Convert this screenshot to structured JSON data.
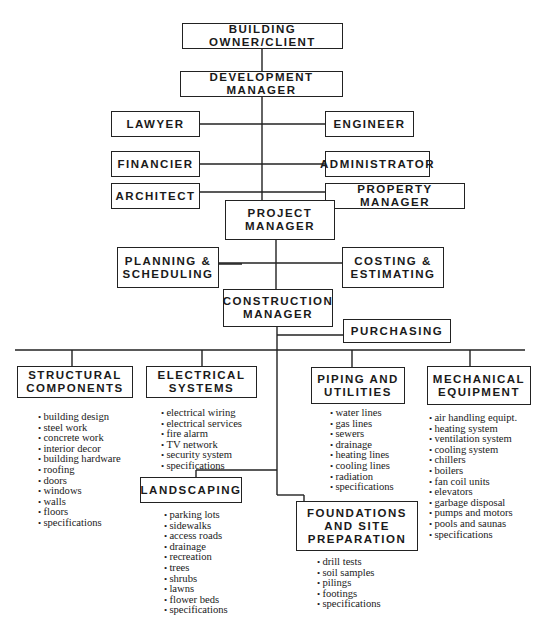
{
  "diagram": {
    "type": "organization-chart",
    "nodes": {
      "owner": "BUILDING OWNER/CLIENT",
      "dev_manager": "DEVELOPMENT MANAGER",
      "lawyer": "LAWYER",
      "engineer": "ENGINEER",
      "financier": "FINANCIER",
      "administrator": "ADMINISTRATOR",
      "architect": "ARCHITECT",
      "property_manager": "PROPERTY MANAGER",
      "project_manager": "PROJECT\nMANAGER",
      "planning": "PLANNING &\nSCHEDULING",
      "costing": "COSTING &\nESTIMATING",
      "construction_manager": "CONSTRUCTION\nMANAGER",
      "purchasing": "PURCHASING",
      "structural": "STRUCTURAL\nCOMPONENTS",
      "electrical": "ELECTRICAL\nSYSTEMS",
      "piping": "PIPING AND\nUTILITIES",
      "mechanical": "MECHANICAL\nEQUIPMENT",
      "landscaping": "LANDSCAPING",
      "foundations": "FOUNDATIONS\nAND SITE\nPREPARATION"
    },
    "lists": {
      "structural": [
        "building design",
        "steel work",
        "concrete work",
        "interior decor",
        "building hardware",
        "roofing",
        "doors",
        "windows",
        "walls",
        "floors",
        "specifications"
      ],
      "electrical": [
        "electrical wiring",
        "electrical services",
        "fire alarm",
        "TV network",
        "security system",
        "specifications"
      ],
      "piping": [
        "water lines",
        "gas lines",
        "sewers",
        "drainage",
        "heating lines",
        "cooling lines",
        "radiation",
        "specifications"
      ],
      "mechanical": [
        "air handling equipt.",
        "heating system",
        "ventilation system",
        "cooling system",
        "chillers",
        "boilers",
        "fan coil units",
        "elevators",
        "garbage disposal",
        "pumps and motors",
        "pools and saunas",
        "specifications"
      ],
      "landscaping": [
        "parking lots",
        "sidewalks",
        "access roads",
        "drainage",
        "recreation",
        "trees",
        "shrubs",
        "lawns",
        "flower beds",
        "specifications"
      ],
      "foundations": [
        "drill tests",
        "soil samples",
        "pilings",
        "footings",
        "specifications"
      ]
    },
    "edges": [
      [
        "owner",
        "dev_manager"
      ],
      [
        "dev_manager",
        "lawyer"
      ],
      [
        "dev_manager",
        "engineer"
      ],
      [
        "dev_manager",
        "financier"
      ],
      [
        "dev_manager",
        "administrator"
      ],
      [
        "dev_manager",
        "architect"
      ],
      [
        "dev_manager",
        "property_manager"
      ],
      [
        "dev_manager",
        "project_manager"
      ],
      [
        "project_manager",
        "planning"
      ],
      [
        "project_manager",
        "costing"
      ],
      [
        "project_manager",
        "construction_manager"
      ],
      [
        "construction_manager",
        "purchasing"
      ],
      [
        "construction_manager",
        "structural"
      ],
      [
        "construction_manager",
        "electrical"
      ],
      [
        "construction_manager",
        "piping"
      ],
      [
        "construction_manager",
        "mechanical"
      ],
      [
        "construction_manager",
        "landscaping"
      ],
      [
        "construction_manager",
        "foundations"
      ]
    ]
  }
}
